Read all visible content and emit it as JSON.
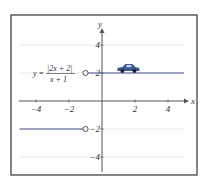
{
  "chart_data": {
    "type": "line",
    "title": "",
    "xlabel": "x",
    "ylabel": "y",
    "xlim": [
      -5,
      5
    ],
    "ylim": [
      -5,
      5
    ],
    "grid": "horizontal",
    "xticks": [
      -4,
      -2,
      2,
      4
    ],
    "yticks": [
      4,
      2,
      -2,
      -4
    ],
    "xtick_labels": [
      "−4",
      "−2",
      "2",
      "4"
    ],
    "ytick_labels": [
      "4",
      "2",
      "−2",
      "−4"
    ],
    "equation": {
      "lhs": "y =",
      "numerator": "|2x + 2|",
      "denominator": "x + 1"
    },
    "series": [
      {
        "name": "right-branch",
        "x": [
          -1,
          5
        ],
        "y": [
          2,
          2
        ],
        "start": "open",
        "color": "#4a4f8c"
      },
      {
        "name": "left-branch",
        "x": [
          -5,
          -1
        ],
        "y": [
          -2,
          -2
        ],
        "end": "open",
        "color": "#4a4f8c"
      }
    ],
    "open_points": [
      {
        "x": -1,
        "y": 2
      },
      {
        "x": -1,
        "y": -2
      }
    ],
    "decoration": {
      "icon": "car",
      "x": 1.6,
      "y": 2,
      "color": "#3b5a8c"
    }
  }
}
